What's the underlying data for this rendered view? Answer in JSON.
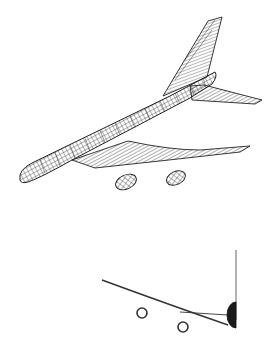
{
  "figure": {
    "views": [
      {
        "name": "perspective-view",
        "description": "3D wireframe of jet airliner with fuselage, swept wings, vertical tail, horizontal stabilizer, two engine nacelles"
      },
      {
        "name": "front-view",
        "description": "partial front view showing wing curve, two engine rings, fuselage cross-section and vertical tail line"
      }
    ],
    "colors": {
      "background": "#ffffff",
      "line": "#222222",
      "fill-dark": "#1a1a1a"
    }
  }
}
